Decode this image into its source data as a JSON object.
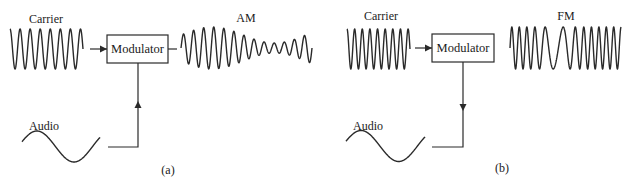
{
  "panels": [
    {
      "id": "a",
      "caption": "(a)",
      "carrier_label": "Carrier",
      "modulator_label": "Modulator",
      "audio_label": "Audio",
      "output_label": "AM",
      "carrier_cycles": 7,
      "audio_arrow_direction": "up"
    },
    {
      "id": "b",
      "caption": "(b)",
      "carrier_label": "Carrier",
      "modulator_label": "Modulator",
      "audio_label": "Audio",
      "output_label": "FM",
      "carrier_cycles": 8,
      "audio_arrow_direction": "down"
    }
  ],
  "colors": {
    "ink": "#2a2a2a",
    "background": "#ffffff"
  }
}
